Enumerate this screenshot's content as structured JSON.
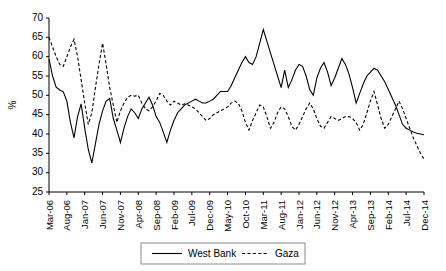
{
  "chart_data": {
    "type": "line",
    "title": "",
    "xlabel": "",
    "ylabel": "%",
    "ylim": [
      25,
      70
    ],
    "yticks": [
      25,
      30,
      35,
      40,
      45,
      50,
      55,
      60,
      65,
      70
    ],
    "grid": false,
    "legend_position": "bottom-center",
    "x_tick_interval_months": 5,
    "x_tick_labels": [
      "Mar-06",
      "Aug-06",
      "Jan-07",
      "Jun-07",
      "Nov-07",
      "Apr-08",
      "Sep-08",
      "Feb-09",
      "Jul-09",
      "Dec-09",
      "May-10",
      "Oct-10",
      "Mar-11",
      "Aug-11",
      "Jan-12",
      "Jun-12",
      "Nov-12",
      "Apr-13",
      "Sep-13",
      "Feb-14",
      "Jul-14",
      "Dec-14"
    ],
    "x_start": "Mar-06",
    "x_end": "Dec-14",
    "x_all_labels": [
      "Mar-06",
      "Apr-06",
      "May-06",
      "Jun-06",
      "Jul-06",
      "Aug-06",
      "Sep-06",
      "Oct-06",
      "Nov-06",
      "Dec-06",
      "Jan-07",
      "Feb-07",
      "Mar-07",
      "Apr-07",
      "May-07",
      "Jun-07",
      "Jul-07",
      "Aug-07",
      "Sep-07",
      "Oct-07",
      "Nov-07",
      "Dec-07",
      "Jan-08",
      "Feb-08",
      "Mar-08",
      "Apr-08",
      "May-08",
      "Jun-08",
      "Jul-08",
      "Aug-08",
      "Sep-08",
      "Oct-08",
      "Nov-08",
      "Dec-08",
      "Jan-09",
      "Feb-09",
      "Mar-09",
      "Apr-09",
      "May-09",
      "Jun-09",
      "Jul-09",
      "Aug-09",
      "Sep-09",
      "Oct-09",
      "Nov-09",
      "Dec-09",
      "Jan-10",
      "Feb-10",
      "Mar-10",
      "Apr-10",
      "May-10",
      "Jun-10",
      "Jul-10",
      "Aug-10",
      "Sep-10",
      "Oct-10",
      "Nov-10",
      "Dec-10",
      "Jan-11",
      "Feb-11",
      "Mar-11",
      "Apr-11",
      "May-11",
      "Jun-11",
      "Jul-11",
      "Aug-11",
      "Sep-11",
      "Oct-11",
      "Nov-11",
      "Dec-11",
      "Jan-12",
      "Feb-12",
      "Mar-12",
      "Apr-12",
      "May-12",
      "Jun-12",
      "Jul-12",
      "Aug-12",
      "Sep-12",
      "Oct-12",
      "Nov-12",
      "Dec-12",
      "Jan-13",
      "Feb-13",
      "Mar-13",
      "Apr-13",
      "May-13",
      "Jun-13",
      "Jul-13",
      "Aug-13",
      "Sep-13",
      "Oct-13",
      "Nov-13",
      "Dec-13",
      "Jan-14",
      "Feb-14",
      "Mar-14",
      "Apr-14",
      "May-14",
      "Jun-14",
      "Jul-14",
      "Aug-14",
      "Sep-14",
      "Oct-14",
      "Nov-14",
      "Dec-14"
    ],
    "series": [
      {
        "name": "West Bank",
        "style": "solid",
        "color": "#000000",
        "values": [
          59.4,
          55.0,
          52.1,
          51.4,
          50.9,
          48.5,
          43.0,
          39.0,
          44.5,
          47.8,
          41.5,
          36.0,
          32.5,
          37.5,
          42.5,
          46.0,
          48.5,
          49.2,
          44.0,
          41.0,
          37.8,
          41.5,
          44.5,
          46.5,
          45.5,
          44.0,
          46.5,
          48.0,
          49.5,
          47.5,
          44.5,
          43.0,
          40.5,
          37.8,
          41.0,
          43.5,
          45.5,
          46.5,
          47.5,
          48.0,
          48.5,
          49.0,
          48.5,
          48.0,
          48.0,
          48.5,
          49.0,
          50.0,
          51.0,
          51.0,
          51.0,
          52.5,
          54.5,
          56.5,
          58.5,
          60.0,
          58.5,
          58.0,
          60.0,
          63.5,
          67.0,
          64.0,
          61.0,
          58.0,
          55.0,
          52.0,
          56.5,
          52.0,
          54.0,
          56.5,
          58.0,
          57.5,
          55.0,
          51.5,
          50.0,
          54.5,
          57.0,
          58.5,
          56.0,
          52.5,
          54.5,
          57.0,
          59.5,
          58.0,
          55.5,
          52.0,
          48.0,
          50.5,
          53.0,
          55.0,
          56.0,
          57.0,
          56.5,
          55.0,
          53.5,
          51.5,
          49.5,
          47.5,
          45.0,
          42.5,
          41.5,
          41.0,
          40.5,
          40.2,
          40.0,
          39.8
        ]
      },
      {
        "name": "Gaza",
        "style": "dashed",
        "color": "#000000",
        "values": [
          65.0,
          62.5,
          60.0,
          58.0,
          57.5,
          60.0,
          62.5,
          64.5,
          60.0,
          54.0,
          48.0,
          42.5,
          45.5,
          52.0,
          58.0,
          63.5,
          58.0,
          52.0,
          47.5,
          43.0,
          46.0,
          48.0,
          49.5,
          50.0,
          49.8,
          50.0,
          48.0,
          46.5,
          46.0,
          47.0,
          48.5,
          50.5,
          50.0,
          48.5,
          47.5,
          48.5,
          48.0,
          47.5,
          47.8,
          47.5,
          47.0,
          46.5,
          45.5,
          44.5,
          43.5,
          44.0,
          45.0,
          45.5,
          46.0,
          46.5,
          47.0,
          48.0,
          48.5,
          48.0,
          46.0,
          43.0,
          41.0,
          43.5,
          45.5,
          47.5,
          47.0,
          44.5,
          41.5,
          43.0,
          45.5,
          47.0,
          46.5,
          44.5,
          42.0,
          41.0,
          42.5,
          44.5,
          46.5,
          48.0,
          46.5,
          44.0,
          42.0,
          41.5,
          43.0,
          44.5,
          44.0,
          43.5,
          44.0,
          44.5,
          44.5,
          44.0,
          43.0,
          41.0,
          42.5,
          45.5,
          48.5,
          51.0,
          47.5,
          44.0,
          41.5,
          42.5,
          44.5,
          46.5,
          48.5,
          46.5,
          44.0,
          41.5,
          39.0,
          37.0,
          35.0,
          33.5
        ]
      }
    ]
  },
  "legend": {
    "items": [
      {
        "label": "West Bank",
        "style": "solid"
      },
      {
        "label": "Gaza",
        "style": "dashed"
      }
    ]
  }
}
